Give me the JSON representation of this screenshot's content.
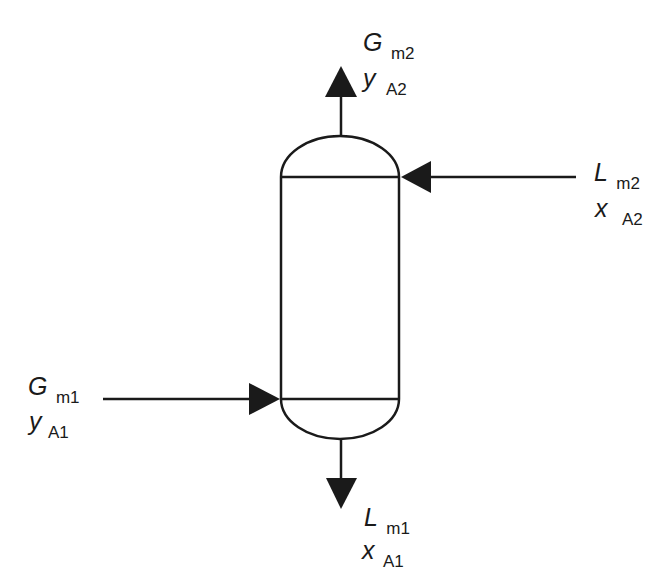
{
  "diagram": {
    "type": "absorption-column",
    "stroke_color": "#1a1a1a",
    "background": "#ffffff",
    "streams": {
      "gas_out": {
        "symbol": "G",
        "subscript": "m2",
        "fraction_symbol": "y",
        "fraction_subscript": "A2",
        "direction": "up"
      },
      "liquid_in": {
        "symbol": "L",
        "subscript": "m2",
        "fraction_symbol": "x",
        "fraction_subscript": "A2",
        "direction": "left"
      },
      "gas_in": {
        "symbol": "G",
        "subscript": "m1",
        "fraction_symbol": "y",
        "fraction_subscript": "A1",
        "direction": "right"
      },
      "liquid_out": {
        "symbol": "L",
        "subscript": "m1",
        "fraction_symbol": "x",
        "fraction_subscript": "A1",
        "direction": "down"
      }
    }
  }
}
